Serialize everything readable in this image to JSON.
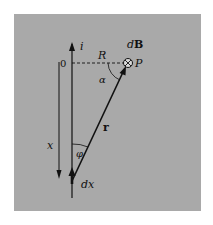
{
  "figure": {
    "panel_color": "#a9a9a9",
    "ink_color": "#111111",
    "labels": {
      "current": "i",
      "origin": "0",
      "distance": "R",
      "field": "dB",
      "field_prefix": "d",
      "field_symbol": "B",
      "point": "P",
      "angle_alpha": "α",
      "position_vector": "r",
      "coordinate": "x",
      "angle_phi": "φ",
      "element": "dx"
    },
    "field_direction_symbol": "⊗"
  }
}
